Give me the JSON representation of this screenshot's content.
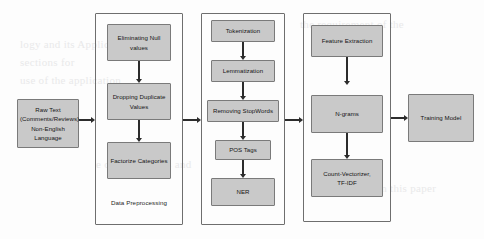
{
  "diagram": {
    "type": "flowchart",
    "input_node": {
      "id": "raw-text",
      "lines": [
        "Raw Text",
        "(Comments/Reviews)",
        "Non-English",
        "Language"
      ]
    },
    "output_node": {
      "id": "training-model",
      "label": "Training Model"
    },
    "groups": [
      {
        "id": "data-preprocessing",
        "label": "Data Preprocessing",
        "nodes": [
          {
            "id": "eliminating-null-values",
            "lines": [
              "Eliminating Null",
              "values"
            ]
          },
          {
            "id": "dropping-duplicate-values",
            "lines": [
              "Dropping Duplicate",
              "Values"
            ]
          },
          {
            "id": "factorize-categories",
            "lines": [
              "Factorize Categories"
            ]
          }
        ]
      },
      {
        "id": "text-processing",
        "label": "",
        "nodes": [
          {
            "id": "tokenization",
            "lines": [
              "Tokenization"
            ]
          },
          {
            "id": "lemmatization",
            "lines": [
              "Lemmatization"
            ]
          },
          {
            "id": "removing-stopwords",
            "lines": [
              "Removing StopWords"
            ]
          },
          {
            "id": "pos-tags",
            "lines": [
              "POS Tags"
            ]
          },
          {
            "id": "ner",
            "lines": [
              "NER"
            ]
          }
        ]
      },
      {
        "id": "feature-engineering",
        "label": "",
        "nodes": [
          {
            "id": "feature-extraction",
            "lines": [
              "Feature Extraction"
            ]
          },
          {
            "id": "n-grams",
            "lines": [
              "N-grams"
            ]
          },
          {
            "id": "count-vectorizer-tfidf",
            "lines": [
              "Count-Vectorizer,",
              "TF-IDF"
            ]
          }
        ]
      }
    ],
    "colors": {
      "node_fill": "#c9c9c9",
      "node_border": "#7a7a7a",
      "group_border": "#6e6e6e",
      "arrow": "#2c2c2c",
      "background": "#fdfdfd",
      "text": "#141414"
    },
    "bleed_text": [
      "logy and its Applications",
      "sections for",
      "use of the application",
      "e ot the analysis and",
      "the requirement of the",
      "presented in this paper"
    ]
  }
}
